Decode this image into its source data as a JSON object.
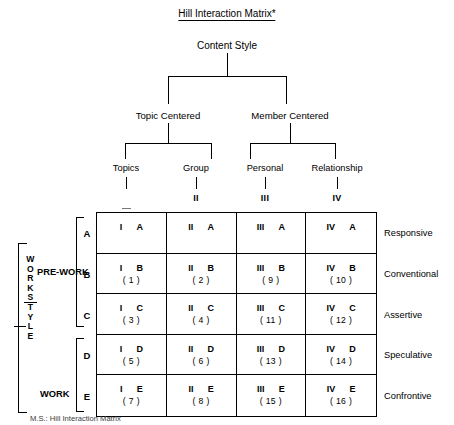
{
  "title": "Hill Interaction Matrix*",
  "root": {
    "label": "Content Style"
  },
  "tier2": [
    {
      "label": "Topic Centered"
    },
    {
      "label": "Member Centered"
    }
  ],
  "columns": [
    {
      "label": "Topics",
      "numeral": "I",
      "numeral_visible": ""
    },
    {
      "label": "Group",
      "numeral": "II",
      "numeral_visible": "II"
    },
    {
      "label": "Personal",
      "numeral": "III",
      "numeral_visible": "III"
    },
    {
      "label": "Relationship",
      "numeral": "IV",
      "numeral_visible": "IV"
    }
  ],
  "rows": [
    {
      "letter": "A",
      "right_label": "Responsive"
    },
    {
      "letter": "B",
      "right_label": "Conventional"
    },
    {
      "letter": "C",
      "right_label": "Assertive"
    },
    {
      "letter": "D",
      "right_label": "Speculative"
    },
    {
      "letter": "E",
      "right_label": "Confrontive"
    }
  ],
  "cells": [
    [
      {
        "col": "I",
        "row": "A",
        "num": ""
      },
      {
        "col": "II",
        "row": "A",
        "num": ""
      },
      {
        "col": "III",
        "row": "A",
        "num": ""
      },
      {
        "col": "IV",
        "row": "A",
        "num": ""
      }
    ],
    [
      {
        "col": "I",
        "row": "B",
        "num": "( 1 )"
      },
      {
        "col": "II",
        "row": "B",
        "num": "( 2 )"
      },
      {
        "col": "III",
        "row": "B",
        "num": "( 9 )"
      },
      {
        "col": "IV",
        "row": "B",
        "num": "( 10 )"
      }
    ],
    [
      {
        "col": "I",
        "row": "C",
        "num": "( 3 )"
      },
      {
        "col": "II",
        "row": "C",
        "num": "( 4 )"
      },
      {
        "col": "III",
        "row": "C",
        "num": "( 11 )"
      },
      {
        "col": "IV",
        "row": "C",
        "num": "( 12 )"
      }
    ],
    [
      {
        "col": "I",
        "row": "D",
        "num": "( 5 )"
      },
      {
        "col": "II",
        "row": "D",
        "num": "( 6 )"
      },
      {
        "col": "III",
        "row": "D",
        "num": "( 13 )"
      },
      {
        "col": "IV",
        "row": "D",
        "num": "( 14 )"
      }
    ],
    [
      {
        "col": "I",
        "row": "E",
        "num": "( 7 )"
      },
      {
        "col": "II",
        "row": "E",
        "num": "( 8 )"
      },
      {
        "col": "III",
        "row": "E",
        "num": "( 15 )"
      },
      {
        "col": "IV",
        "row": "E",
        "num": "( 16 )"
      }
    ]
  ],
  "left_axis": {
    "prework": "PRE-WORK",
    "work": "WORK",
    "vertical_letters": [
      "W",
      "O",
      "R",
      "K",
      "S",
      "T",
      "Y",
      "L",
      "E"
    ]
  },
  "caption": "M.S.: Hill Interaction Matrix"
}
